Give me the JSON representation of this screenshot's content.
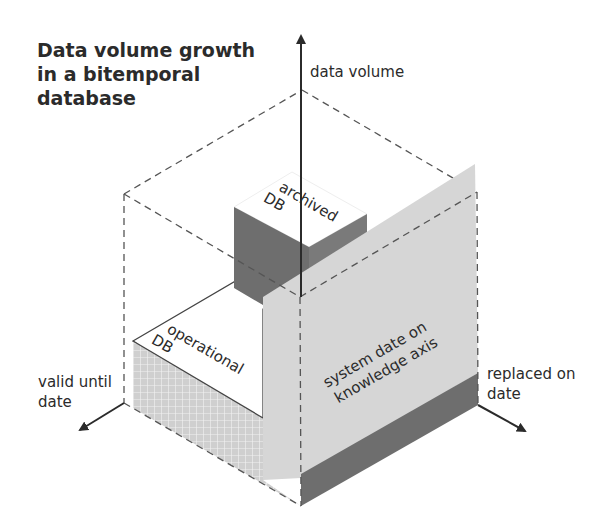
{
  "title": {
    "lines": [
      "Data volume growth",
      "in a bitemporal",
      "database"
    ]
  },
  "axes": {
    "vertical": {
      "label": "data volume",
      "icon": "arrow-up-icon"
    },
    "left": {
      "lines": [
        "valid until",
        "date"
      ],
      "icon": "arrow-down-left-icon"
    },
    "right": {
      "lines": [
        "replaced on",
        "date"
      ],
      "icon": "arrow-down-right-icon"
    }
  },
  "blocks": {
    "archived": {
      "lines": [
        "archived",
        "DB"
      ]
    },
    "operational": {
      "lines": [
        "operational",
        "DB"
      ]
    },
    "panel": {
      "lines": [
        "system date on",
        "knowledge axis"
      ]
    }
  },
  "colors": {
    "text": "#2b2b2b",
    "axis": "#2b2b2b",
    "dashed": "#555555",
    "dark_face": "#6e6e6e",
    "light_panel": "#d6d6d6",
    "top_face": "#ffffff",
    "hatch_bg": "#cfcfcf",
    "hatch_line": "#f2f2f2"
  }
}
